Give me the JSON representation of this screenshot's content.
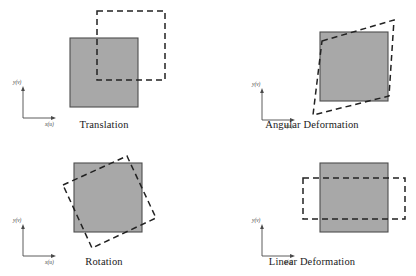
{
  "figure": {
    "background_color": "#ffffff",
    "square_fill": "#a8a8a8",
    "square_stroke": "#4d4d4d",
    "dashed_stroke": "#222222",
    "axis_stroke": "#4a4a4a"
  },
  "axes": {
    "y_label": "y(v)",
    "x_label": "x(u)"
  },
  "panels": [
    {
      "id": "translation",
      "caption": "Translation",
      "description": "Dashed square displaced right and upward from the original shaded square",
      "original": {
        "x": 70,
        "y": 38,
        "width": 68,
        "height": 69
      },
      "deformed_points": "97,11 165,11 165,80 97,80",
      "offset": {
        "dx": 27,
        "dy": -27
      }
    },
    {
      "id": "angular",
      "caption": "Angular Deformation",
      "description": "Dashed parallelogram sheared relative to the original shaded square",
      "original": {
        "x": 320,
        "y": 32,
        "width": 68,
        "height": 69
      },
      "deformed_points": "322,41 394,20 389,96 313,115",
      "shear_angle_deg": 15
    },
    {
      "id": "rotation",
      "caption": "Rotation",
      "description": "Dashed square rotated counterclockwise about the centre of the original shaded square",
      "original": {
        "x": 74,
        "y": 163,
        "width": 68,
        "height": 69
      },
      "deformed_points": "63,185 127,156 156,218 92,248",
      "rotation_deg": 13
    },
    {
      "id": "linear",
      "caption": "Linear Deformation",
      "description": "Dashed rectangle stretched horizontally and compressed vertically relative to the original shaded square",
      "original": {
        "x": 320,
        "y": 163,
        "width": 68,
        "height": 69
      },
      "deformed_points": "303,178 405,178 405,219 303,219",
      "scale": {
        "sx": 1.5,
        "sy": 0.6
      }
    }
  ],
  "bleed": {
    "left_text": "",
    "right_text": ""
  }
}
